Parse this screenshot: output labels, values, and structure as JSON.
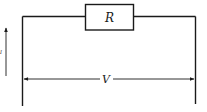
{
  "diagram": {
    "type": "circuit",
    "resistor": {
      "label": "R"
    },
    "voltage": {
      "label": "V"
    },
    "side_arrow": {
      "label": "I",
      "label_confidence": "low",
      "direction": "up"
    },
    "colors": {
      "line": "#1a1a1a",
      "background": "#ffffff"
    }
  }
}
